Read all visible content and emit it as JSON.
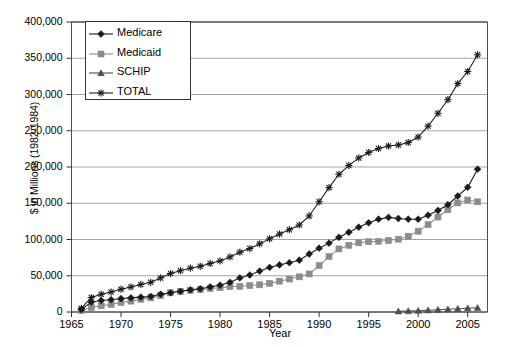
{
  "chart_data": {
    "type": "line",
    "title": "",
    "xlabel": "Year",
    "ylabel": "$ in Millions (1982-1984)",
    "xlim": [
      1965,
      2007
    ],
    "ylim": [
      0,
      400000
    ],
    "grid": true,
    "legend_position": "top-left",
    "x_ticks": [
      "1965",
      "1970",
      "1975",
      "1980",
      "1985",
      "1990",
      "1995",
      "2000",
      "2005"
    ],
    "x_tick_values": [
      1965,
      1970,
      1975,
      1980,
      1985,
      1990,
      1995,
      2000,
      2005
    ],
    "y_ticks": [
      "0",
      "50,000",
      "100,000",
      "150,000",
      "200,000",
      "250,000",
      "300,000",
      "350,000",
      "400,000"
    ],
    "y_tick_values": [
      0,
      50000,
      100000,
      150000,
      200000,
      250000,
      300000,
      350000,
      400000
    ],
    "x": [
      1966,
      1967,
      1968,
      1969,
      1970,
      1971,
      1972,
      1973,
      1974,
      1975,
      1976,
      1977,
      1978,
      1979,
      1980,
      1981,
      1982,
      1983,
      1984,
      1985,
      1986,
      1987,
      1988,
      1989,
      1990,
      1991,
      1992,
      1993,
      1994,
      1995,
      1996,
      1997,
      1998,
      1999,
      2000,
      2001,
      2002,
      2003,
      2004,
      2005,
      2006
    ],
    "series": [
      {
        "name": "Medicare",
        "marker": "diamond",
        "color": "#1a1a1a",
        "values": [
          3300,
          13800,
          16000,
          17000,
          18500,
          19500,
          20500,
          21500,
          24500,
          26500,
          28500,
          30500,
          32000,
          34500,
          37000,
          41000,
          47000,
          51000,
          56500,
          61500,
          65000,
          68000,
          71500,
          80000,
          88000,
          95000,
          103000,
          110000,
          117000,
          123000,
          128000,
          130500,
          129000,
          128000,
          128000,
          133500,
          140000,
          148000,
          160000,
          172000,
          197000
        ]
      },
      {
        "name": "Medicaid",
        "marker": "square",
        "color": "#8c8c8c",
        "values": [
          1900,
          6200,
          8500,
          10500,
          13000,
          15000,
          17500,
          19500,
          22500,
          26500,
          28500,
          30000,
          31000,
          32500,
          33500,
          35000,
          35500,
          36500,
          37500,
          39500,
          42500,
          45500,
          48500,
          52500,
          64000,
          76500,
          87000,
          92000,
          95500,
          97000,
          97500,
          98500,
          100500,
          104500,
          111500,
          120500,
          131000,
          141000,
          150500,
          154500,
          152000
        ]
      },
      {
        "name": "SCHIP",
        "marker": "triangle",
        "color": "#4d4d4d",
        "values": [
          null,
          null,
          null,
          null,
          null,
          null,
          null,
          null,
          null,
          null,
          null,
          null,
          null,
          null,
          null,
          null,
          null,
          null,
          null,
          null,
          null,
          null,
          null,
          null,
          null,
          null,
          null,
          null,
          null,
          null,
          null,
          null,
          900,
          1300,
          1800,
          2400,
          3100,
          3800,
          4500,
          5200,
          5800
        ]
      },
      {
        "name": "TOTAL",
        "marker": "star",
        "color": "#1a1a1a",
        "values": [
          5200,
          20000,
          24500,
          27500,
          31500,
          34500,
          38000,
          41000,
          47000,
          53000,
          57000,
          60500,
          63000,
          67000,
          70500,
          76000,
          82500,
          87500,
          94000,
          101000,
          107500,
          113500,
          120000,
          132500,
          152000,
          171500,
          190000,
          202000,
          212500,
          220000,
          225500,
          229000,
          230400,
          233800,
          241300,
          256400,
          274100,
          292800,
          315000,
          331700,
          354800
        ]
      }
    ]
  },
  "legend": {
    "items": [
      {
        "label": "Medicare",
        "marker": "diamond",
        "color": "#1a1a1a"
      },
      {
        "label": "Medicaid",
        "marker": "square",
        "color": "#8c8c8c"
      },
      {
        "label": "SCHIP",
        "marker": "triangle",
        "color": "#4d4d4d"
      },
      {
        "label": "TOTAL",
        "marker": "star",
        "color": "#1a1a1a"
      }
    ]
  }
}
